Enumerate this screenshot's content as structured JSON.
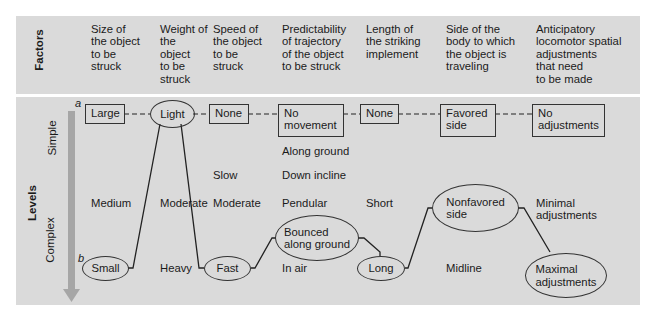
{
  "axis_labels": {
    "factors": "Factors",
    "levels": "Levels",
    "simple": "Simple",
    "complex": "Complex",
    "marker_a": "a",
    "marker_b": "b"
  },
  "factors": [
    {
      "id": "size",
      "header": "Size of\nthe object\nto be\nstruck",
      "levels": {
        "simple": "Large",
        "medium": "Medium",
        "complex": "Small"
      }
    },
    {
      "id": "weight",
      "header": "Weight of\nthe\nobject\nto be\nstruck",
      "levels": {
        "simple": "Light",
        "medium": "Moderate",
        "complex": "Heavy"
      }
    },
    {
      "id": "speed",
      "header": "Speed of\nthe object\nto be\nstruck",
      "levels": {
        "simple": "None",
        "slow": "Slow",
        "medium": "Moderate",
        "complex": "Fast"
      }
    },
    {
      "id": "predictability",
      "header": "Predictability\nof trajectory\nof the object\nto be struck",
      "levels": {
        "simple": "No\nmovement",
        "along_ground": "Along ground",
        "down_incline": "Down incline",
        "medium": "Pendular",
        "bounced": "Bounced\nalong ground",
        "complex": "In air"
      }
    },
    {
      "id": "length",
      "header": "Length of\nthe striking\nimplement",
      "levels": {
        "simple": "None",
        "medium": "Short",
        "complex": "Long"
      }
    },
    {
      "id": "side",
      "header": "Side of the\nbody to which\nthe object is\ntraveling",
      "levels": {
        "simple": "Favored\nside",
        "medium": "Nonfavored\nside",
        "complex": "Midline"
      }
    },
    {
      "id": "adjustments",
      "header": "Anticipatory\nlocomotor spatial\nadjustments\nthat need\nto be made",
      "levels": {
        "simple": "No\nadjustments",
        "medium": "Minimal\nadjustments",
        "complex": "Maximal\nadjustments"
      }
    }
  ],
  "path_a": {
    "style": "dashed",
    "nodes": [
      "Large",
      "Light",
      "None",
      "No movement",
      "None",
      "Favored side",
      "No adjustments"
    ]
  },
  "path_b": {
    "style": "solid",
    "nodes": [
      "Small",
      "Light",
      "Fast",
      "Bounced along ground",
      "Long",
      "Nonfavored side",
      "Maximal adjustments"
    ]
  },
  "colors": {
    "panel": "#dadada",
    "arrow": "#a6a6a6",
    "line": "#222222"
  }
}
